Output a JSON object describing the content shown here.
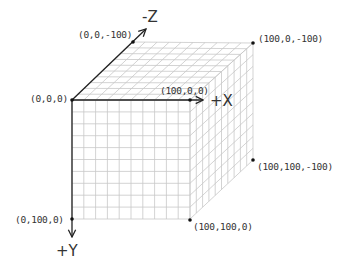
{
  "diagram": {
    "axes": {
      "x": {
        "label": "+X"
      },
      "y": {
        "label": "+Y"
      },
      "z": {
        "label": "-Z"
      }
    },
    "vertices": [
      {
        "id": "origin",
        "label": "(0,0,0)"
      },
      {
        "id": "x100",
        "label": "(100,0,0)"
      },
      {
        "id": "z100",
        "label": "(0,0,-100)"
      },
      {
        "id": "xz100",
        "label": "(100,0,-100)"
      },
      {
        "id": "y100",
        "label": "(0,100,0)"
      },
      {
        "id": "xy100",
        "label": "(100,100,0)"
      },
      {
        "id": "xyz100",
        "label": "(100,100,-100)"
      }
    ],
    "grid": {
      "divisions": 10
    },
    "colors": {
      "edge": "#222222",
      "grid": "#c8c8c8",
      "text": "#333333"
    }
  }
}
